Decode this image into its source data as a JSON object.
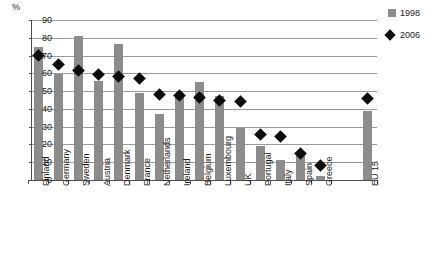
{
  "chart_data": {
    "type": "bar",
    "title": "",
    "xlabel": "",
    "ylabel": "%",
    "ylim": [
      0,
      90
    ],
    "yticks": [
      0,
      10,
      20,
      30,
      40,
      50,
      60,
      70,
      80,
      90
    ],
    "grid": true,
    "legend_position": "right",
    "categories": [
      "Finland",
      "Germany",
      "Sweden",
      "Austria",
      "Denmark",
      "France",
      "Netherlands",
      "Ireland",
      "Belgium",
      "Luxembourg",
      "UK",
      "Portugal",
      "Italy",
      "Spain",
      "Greece",
      "EU 15"
    ],
    "series": [
      {
        "name": "1998",
        "type": "bar",
        "color": "#8c8c8c",
        "values": [
          75,
          59.5,
          81,
          55.5,
          76.5,
          49,
          37,
          47,
          55,
          47,
          29,
          19,
          11,
          14,
          2,
          39
        ]
      },
      {
        "name": "2006",
        "type": "scatter",
        "marker": "diamond",
        "color": "#0d0d0d",
        "values": [
          70,
          65,
          61.5,
          59.5,
          58.5,
          57,
          48,
          47.5,
          46.5,
          44.5,
          44,
          25.5,
          24.5,
          15,
          8,
          46
        ]
      }
    ]
  },
  "axis": {
    "unit_label": "%"
  },
  "legend": {
    "items": [
      {
        "label": "1998",
        "icon": "square-swatch"
      },
      {
        "label": "2006",
        "icon": "diamond-swatch"
      }
    ]
  }
}
